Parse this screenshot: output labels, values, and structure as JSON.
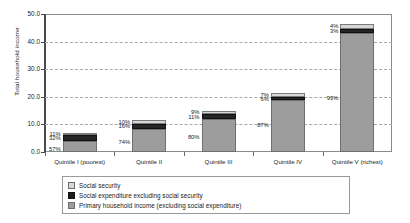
{
  "chart_data": {
    "type": "bar",
    "subtype": "stacked-bar",
    "title": "",
    "xlabel": "",
    "ylabel": "Total household income",
    "ylim": [
      0.0,
      50.0
    ],
    "yticks": [
      "0.0",
      "10.0",
      "20.0",
      "30.0",
      "40.0",
      "50.0"
    ],
    "ytick_values": [
      0.0,
      10.0,
      20.0,
      30.0,
      40.0,
      50.0
    ],
    "grid": true,
    "grid_style": "dashed-horizontal",
    "legend_position": "bottom",
    "categories": [
      "Quintile I (poorest)",
      "Quintile II",
      "Quintile III",
      "Quintile IV",
      "Quintile V (richest)"
    ],
    "series": [
      {
        "name": "Primary household income (excluding social expenditure)",
        "color": "#9d9d9d",
        "values": [
          4.0,
          8.5,
          12.0,
          18.7,
          43.2
        ],
        "labels": [
          "57%",
          "74%",
          "80%",
          "87%",
          "93%"
        ]
      },
      {
        "name": "Social expenditure excluding social security",
        "color": "#1c1c1c",
        "values": [
          2.2,
          1.8,
          1.7,
          1.3,
          1.4
        ],
        "labels": [
          "32%",
          "16%",
          "11%",
          "6%",
          "3%"
        ]
      },
      {
        "name": "Social security",
        "color": "#d6d6d6",
        "values": [
          0.8,
          1.2,
          1.3,
          1.5,
          1.9
        ],
        "labels": [
          "11%",
          "10%",
          "9%",
          "7%",
          "4%"
        ]
      }
    ],
    "totals": [
      7.0,
      11.5,
      15.0,
      21.5,
      46.5
    ],
    "annotations": [
      "11%",
      "32%",
      "57%",
      "10%",
      "16%",
      "74%",
      "9%",
      "11%",
      "80%",
      "7%",
      "6%",
      "87%",
      "4%",
      "3%",
      "93%"
    ]
  },
  "legend": {
    "items": [
      {
        "label": "Social security",
        "color": "#d6d6d6"
      },
      {
        "label": "Social expenditure excluding social security",
        "color": "#1c1c1c"
      },
      {
        "label": "Primary household income (excluding social expenditure)",
        "color": "#9d9d9d"
      }
    ]
  },
  "axis": {
    "y_title": "Total household income",
    "y_ticks": [
      "50.0",
      "40.0",
      "30.0",
      "20.0",
      "10.0",
      "0.0"
    ]
  }
}
